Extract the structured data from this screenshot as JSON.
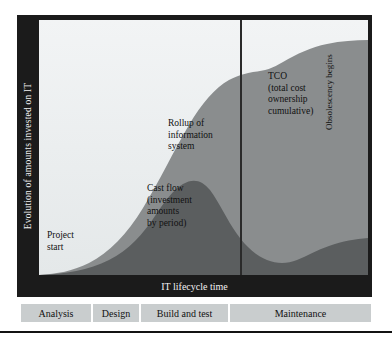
{
  "figure": {
    "y_axis_label": "Evolution of amounts invested on IT",
    "x_axis_label": "IT lifecycle time"
  },
  "annotations": {
    "project_start": "Project\nstart",
    "rollup": "Rollup of\ninformation\nsystem",
    "cash_flow": "Cast flow\n(investment\namounts\nby period)",
    "tco": "TCO\n(total cost\nownership\ncumulative)",
    "obsolescency": "Obsolescency begins"
  },
  "phases": [
    {
      "label": "Analysis",
      "width": 72
    },
    {
      "label": "Design",
      "width": 48
    },
    {
      "label": "Build and test",
      "width": 89
    },
    {
      "label": "Maintenance",
      "width": 143
    }
  ],
  "colors": {
    "frame": "#1b1b1b",
    "plot_background": "#eceff0",
    "tco_area": "#8a8d8e",
    "cash_flow_area": "#5b5e5f",
    "divider_line": "#2a2a2a",
    "phase_cell": "#c9cdce",
    "axis_label_text": "#f2f2f2"
  },
  "chart_data": {
    "type": "area",
    "xlabel": "IT lifecycle time",
    "ylabel": "Evolution of amounts invested on IT",
    "xlim": [
      0,
      100
    ],
    "ylim": [
      0,
      100
    ],
    "grid": false,
    "legend": "in-plot annotations",
    "annotations": [
      {
        "text": "Project start",
        "x": 3,
        "y": 18
      },
      {
        "text": "Rollup of information system",
        "x": 39,
        "y": 60
      },
      {
        "text": "Cast flow (investment amounts by period)",
        "x": 33,
        "y": 34
      },
      {
        "text": "TCO (total cost ownership cumulative)",
        "x": 70,
        "y": 80
      },
      {
        "text": "Obsolescency begins",
        "x": 88,
        "y": 45,
        "rotation": -90
      }
    ],
    "vertical_markers": [
      {
        "label": "end of build and test / start of maintenance",
        "x": 61
      }
    ],
    "series": [
      {
        "name": "TCO (total cost ownership cumulative)",
        "type": "area",
        "color": "#8a8d8e",
        "x": [
          0,
          5,
          10,
          15,
          20,
          25,
          30,
          35,
          40,
          45,
          50,
          55,
          58,
          61,
          65,
          70,
          75,
          80,
          85,
          90,
          95,
          100
        ],
        "y": [
          0,
          1,
          3,
          6,
          11,
          18,
          27,
          37,
          48,
          58,
          66,
          71,
          73,
          74,
          77,
          81,
          84,
          86,
          87,
          88,
          88,
          89
        ]
      },
      {
        "name": "Cast flow (investment amounts by period)",
        "type": "area",
        "color": "#5b5e5f",
        "x": [
          0,
          5,
          10,
          15,
          20,
          25,
          30,
          35,
          40,
          45,
          50,
          55,
          58,
          61,
          65,
          70,
          75,
          80,
          85,
          90,
          95,
          100
        ],
        "y": [
          0,
          0,
          1,
          2,
          4,
          7,
          12,
          18,
          25,
          29,
          30,
          27,
          22,
          16,
          11,
          9,
          8,
          8,
          9,
          10,
          12,
          14
        ]
      }
    ],
    "phase_axis": {
      "name": "IT lifecycle phases",
      "categories": [
        "Analysis",
        "Design",
        "Build and test",
        "Maintenance"
      ],
      "spans": [
        [
          0,
          20
        ],
        [
          20,
          34
        ],
        [
          34,
          59
        ],
        [
          59,
          100
        ]
      ]
    }
  }
}
